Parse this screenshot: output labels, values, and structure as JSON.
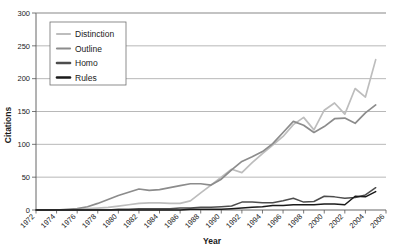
{
  "chart_data": {
    "type": "line",
    "title": "",
    "xlabel": "Year",
    "ylabel": "Citations",
    "xlim": [
      1972,
      2006
    ],
    "ylim": [
      0,
      300
    ],
    "yticks": [
      0,
      50,
      100,
      150,
      200,
      250,
      300
    ],
    "xticks": [
      1972,
      1974,
      1976,
      1978,
      1980,
      1982,
      1984,
      1986,
      1988,
      1990,
      1992,
      1994,
      1996,
      1998,
      2000,
      2002,
      2004,
      2006
    ],
    "grid": true,
    "legend_position": "upper-left",
    "x": [
      1972,
      1973,
      1974,
      1975,
      1976,
      1977,
      1978,
      1979,
      1980,
      1981,
      1982,
      1983,
      1984,
      1985,
      1986,
      1987,
      1988,
      1989,
      1990,
      1991,
      1992,
      1993,
      1994,
      1995,
      1996,
      1997,
      1998,
      1999,
      2000,
      2001,
      2002,
      2003,
      2004,
      2005
    ],
    "series": [
      {
        "name": "Distinction",
        "color": "#bdbdbd",
        "values": [
          0,
          0,
          0,
          0,
          1,
          2,
          3,
          4,
          6,
          8,
          10,
          11,
          11,
          10,
          10,
          14,
          26,
          38,
          50,
          62,
          57,
          72,
          86,
          99,
          112,
          130,
          141,
          122,
          152,
          163,
          146,
          185,
          172,
          229
        ]
      },
      {
        "name": "Outline",
        "color": "#8c8c8c",
        "values": [
          0,
          0,
          0,
          1,
          2,
          5,
          10,
          16,
          22,
          27,
          32,
          30,
          31,
          34,
          37,
          40,
          40,
          38,
          47,
          61,
          74,
          81,
          89,
          101,
          118,
          135,
          129,
          118,
          127,
          139,
          140,
          132,
          148,
          160
        ]
      },
      {
        "name": "Homo",
        "color": "#4d4d4d",
        "values": [
          0,
          0,
          0,
          0,
          0,
          0,
          0,
          0,
          1,
          1,
          2,
          2,
          2,
          2,
          3,
          3,
          4,
          4,
          5,
          6,
          12,
          12,
          11,
          11,
          14,
          18,
          12,
          13,
          21,
          20,
          18,
          19,
          23,
          34
        ]
      },
      {
        "name": "Rules",
        "color": "#1a1a1a",
        "values": [
          0,
          0,
          0,
          0,
          0,
          0,
          0,
          0,
          0,
          0,
          0,
          0,
          0,
          0,
          0,
          1,
          1,
          1,
          1,
          2,
          3,
          4,
          5,
          7,
          7,
          8,
          8,
          8,
          9,
          9,
          8,
          21,
          20,
          28
        ]
      }
    ]
  }
}
